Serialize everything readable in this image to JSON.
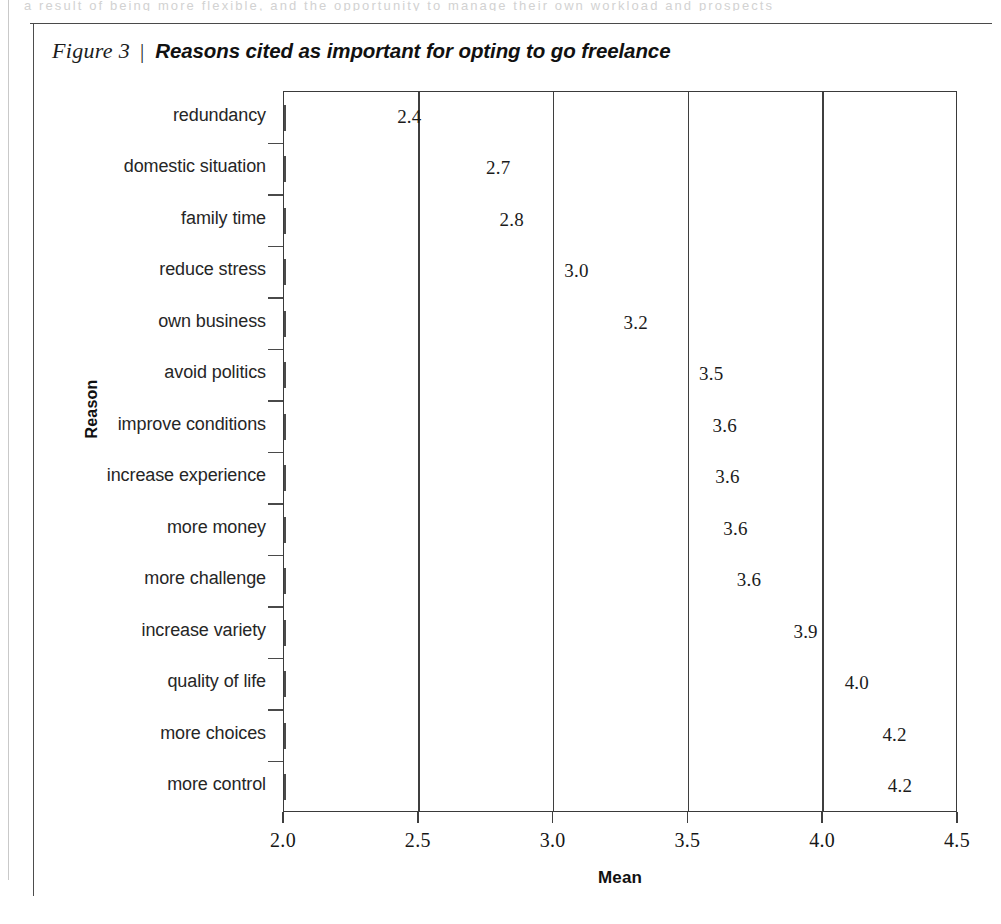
{
  "page": {
    "cut_off_text": "a result of being more flexible, and the opportunity to manage their own workload and prospects"
  },
  "figure": {
    "caption_label": "Figure 3",
    "caption_separator": "|",
    "caption_title": "Reasons cited as important for opting to go freelance"
  },
  "chart_data": {
    "type": "bar",
    "orientation": "horizontal",
    "title": "Reasons cited as important for opting to go freelance",
    "xlabel": "Mean",
    "ylabel": "Reason",
    "xlim": [
      2.0,
      4.5
    ],
    "xticks": [
      "2.0",
      "2.5",
      "3.0",
      "3.5",
      "4.0",
      "4.5"
    ],
    "xtick_values": [
      2.0,
      2.5,
      3.0,
      3.5,
      4.0,
      4.5
    ],
    "gridlines": [
      2.5,
      3.0,
      3.5,
      4.0
    ],
    "grid": true,
    "legend": "none",
    "bar_fill_color": "#d2d2d2",
    "bar_edge_color": "#4b4b4b",
    "categories": [
      "redundancy",
      "domestic situation",
      "family time",
      "reduce stress",
      "own business",
      "avoid politics",
      "improve conditions",
      "increase experience",
      "more money",
      "more challenge",
      "increase variety",
      "quality of life",
      "more choices",
      "more control"
    ],
    "values": [
      2.4,
      2.7,
      2.8,
      3.0,
      3.2,
      3.5,
      3.6,
      3.6,
      3.6,
      3.6,
      3.9,
      4.0,
      4.2,
      4.2
    ],
    "value_labels": [
      "2.4",
      "2.7",
      "2.8",
      "3.0",
      "3.2",
      "3.5",
      "3.6",
      "3.6",
      "3.6",
      "3.6",
      "3.9",
      "4.0",
      "4.2",
      "4.2"
    ],
    "plotted_lengths": [
      2.39,
      2.72,
      2.77,
      3.01,
      3.23,
      3.51,
      3.56,
      3.57,
      3.6,
      3.65,
      3.86,
      4.05,
      4.19,
      4.21
    ]
  }
}
